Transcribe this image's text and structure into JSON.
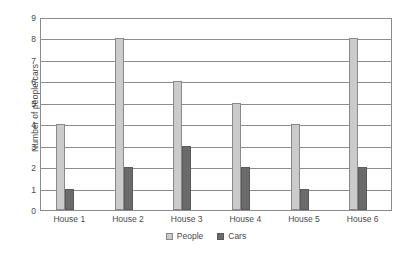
{
  "chart_data": {
    "type": "bar",
    "title": "",
    "xlabel": "",
    "ylabel": "Number of people/cars",
    "categories": [
      "House 1",
      "House 2",
      "House 3",
      "House 4",
      "House 5",
      "House 6"
    ],
    "series": [
      {
        "name": "People",
        "values": [
          4,
          8,
          6,
          5,
          4,
          8
        ],
        "color": "#cbcbcb"
      },
      {
        "name": "Cars",
        "values": [
          1,
          2,
          3,
          2,
          1,
          2
        ],
        "color": "#6b6b6b"
      }
    ],
    "ylim": [
      0,
      9
    ],
    "ytick_labels": [
      "0",
      "1",
      "2",
      "3",
      "4",
      "5",
      "6",
      "7",
      "8",
      "9"
    ],
    "ytick_values": [
      0,
      1,
      2,
      3,
      4,
      5,
      6,
      7,
      8,
      9
    ],
    "grid": "horizontal",
    "legend_position": "bottom-center"
  }
}
